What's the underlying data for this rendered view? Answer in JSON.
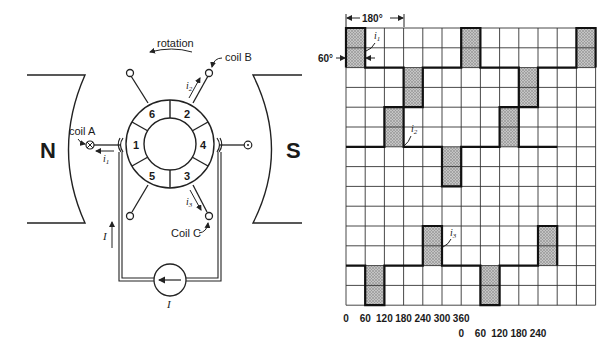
{
  "motor_diagram": {
    "north_pole_label": "N",
    "south_pole_label": "S",
    "rotation_label": "rotation",
    "coil_a_label": "coil A",
    "coil_b_label": "coil B",
    "coil_c_label": "Coil C",
    "current_i1": "i",
    "current_i1_sub": "1",
    "current_i2": "i",
    "current_i2_sub": "2",
    "current_i3": "i",
    "current_i3_sub": "3",
    "supply_current_label": "I",
    "source_current_label": "I",
    "segments": [
      "1",
      "2",
      "3",
      "4",
      "5",
      "6"
    ]
  },
  "waveform_chart": {
    "span_label": "180°",
    "width_label": "60°",
    "i1_label": "i",
    "i1_sub": "1",
    "i2_label": "i",
    "i2_sub": "2",
    "i3_label": "i",
    "i3_sub": "3",
    "x_ticks_row1": [
      "0",
      "60",
      "120",
      "180",
      "240",
      "300",
      "360"
    ],
    "x_ticks_row2": [
      "0",
      "60",
      "120",
      "180",
      "240"
    ],
    "columns": 13,
    "rows": 14,
    "column_degrees": 60,
    "waveforms": [
      {
        "name": "i1",
        "baseline_row": 2,
        "positive_cols": [
          0,
          6,
          12
        ],
        "negative_cols": [
          3,
          9
        ]
      },
      {
        "name": "i2",
        "baseline_row": 6,
        "positive_cols": [
          2,
          8
        ],
        "negative_cols": [
          5
        ]
      },
      {
        "name": "i3",
        "baseline_row": 12,
        "positive_cols": [
          4,
          10
        ],
        "negative_cols": [
          1,
          7
        ]
      }
    ],
    "colors": {
      "grid": "#333333",
      "pulse_fill": "#b8b8b8",
      "trace": "#111111"
    }
  }
}
